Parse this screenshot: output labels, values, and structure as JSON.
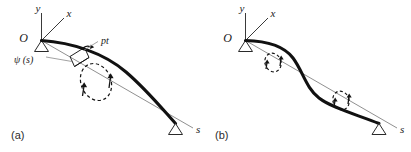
{
  "figure": {
    "background_color": "#ffffff",
    "beam_color": "#111111",
    "chord_color": "#7c7c7c",
    "axis_color": "#3a3a3a",
    "label_color": "#1a1a1a",
    "width": 411,
    "height": 152
  },
  "panels": [
    {
      "id": "panel-a",
      "caption": "(a)",
      "origin_label": "O",
      "axis_y_label": "y",
      "axis_x_label": "x",
      "arclength_label": "s",
      "point_label": "pt",
      "angle_label": "ψ (s)",
      "shape": "single-curvature-arc",
      "rotation_markers": 1
    },
    {
      "id": "panel-b",
      "caption": "(b)",
      "origin_label": "O",
      "axis_y_label": "y",
      "axis_x_label": "x",
      "arclength_label": "s",
      "shape": "double-curvature-s-curve",
      "rotation_markers": 2
    }
  ]
}
